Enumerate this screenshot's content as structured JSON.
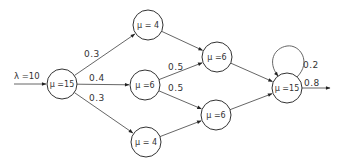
{
  "diagram": {
    "type": "queueing-network",
    "input": {
      "label": "λ =10",
      "target": "n1"
    },
    "nodes": [
      {
        "id": "n1",
        "label": "μ =15"
      },
      {
        "id": "n2",
        "label": "μ = 4"
      },
      {
        "id": "n3",
        "label": "μ =6"
      },
      {
        "id": "n4",
        "label": "μ = 4"
      },
      {
        "id": "n5",
        "label": "μ =6"
      },
      {
        "id": "n6",
        "label": "μ =6"
      },
      {
        "id": "n7",
        "label": "μ =15"
      }
    ],
    "edges": [
      {
        "from": "n1",
        "to": "n2",
        "label": "0.3"
      },
      {
        "from": "n1",
        "to": "n3",
        "label": "0.4"
      },
      {
        "from": "n1",
        "to": "n4",
        "label": "0.3"
      },
      {
        "from": "n2",
        "to": "n5",
        "label": ""
      },
      {
        "from": "n3",
        "to": "n5",
        "label": "0.5"
      },
      {
        "from": "n3",
        "to": "n6",
        "label": "0.5"
      },
      {
        "from": "n4",
        "to": "n6",
        "label": ""
      },
      {
        "from": "n5",
        "to": "n7",
        "label": ""
      },
      {
        "from": "n6",
        "to": "n7",
        "label": ""
      },
      {
        "from": "n7",
        "to": "n7",
        "label": "0.2"
      }
    ],
    "output": {
      "from": "n7",
      "label": "0.8"
    }
  }
}
